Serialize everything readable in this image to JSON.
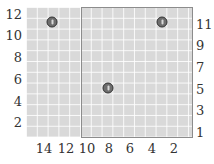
{
  "figure": {
    "left_axis": {
      "ticks": [
        {
          "label": "12",
          "y": 14
        },
        {
          "label": "10",
          "y": 35
        },
        {
          "label": "8",
          "y": 57
        },
        {
          "label": "6",
          "y": 79
        },
        {
          "label": "4",
          "y": 101
        },
        {
          "label": "2",
          "y": 122
        }
      ]
    },
    "right_axis": {
      "ticks": [
        {
          "label": "11",
          "y": 24
        },
        {
          "label": "9",
          "y": 45
        },
        {
          "label": "7",
          "y": 67
        },
        {
          "label": "5",
          "y": 89
        },
        {
          "label": "3",
          "y": 110
        },
        {
          "label": "1",
          "y": 132
        }
      ]
    },
    "bottom_axis": {
      "ticks": [
        {
          "label": "14",
          "x": 44
        },
        {
          "label": "12",
          "x": 66
        },
        {
          "label": "10",
          "x": 87
        },
        {
          "label": "8",
          "x": 109
        },
        {
          "label": "6",
          "x": 130
        },
        {
          "label": "4",
          "x": 152
        },
        {
          "label": "2",
          "x": 174
        }
      ]
    },
    "markers": [
      {
        "name": "marker-1",
        "x": 52,
        "y": 22
      },
      {
        "name": "marker-2",
        "x": 162,
        "y": 22
      },
      {
        "name": "marker-3",
        "x": 108,
        "y": 88
      }
    ],
    "colors": {
      "grid_background": "#d9d9d9",
      "grid_lines": "#ffffff",
      "rectangle_border": "#8c8c8c",
      "marker_fill": "#6e6e6e",
      "label_text": "#333333"
    }
  }
}
